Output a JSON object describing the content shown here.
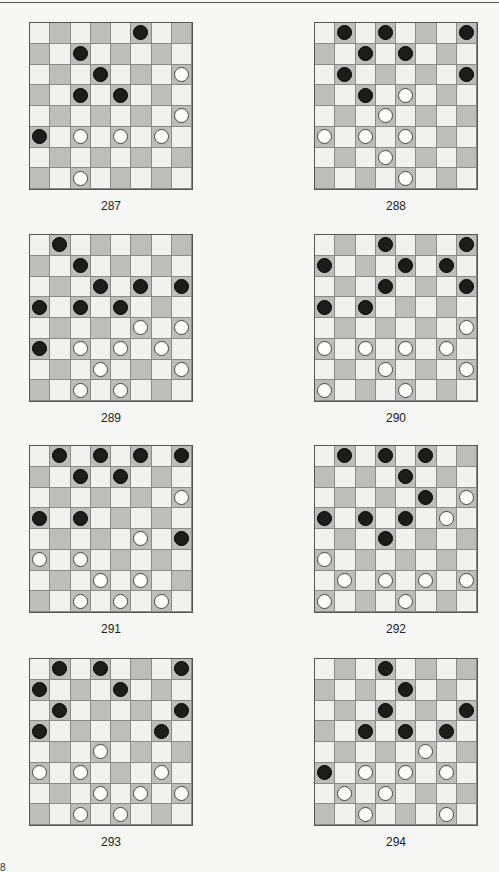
{
  "page": {
    "layout": "2 columns x 4 rows of checkers diagrams",
    "colors": {
      "dark_square": "#bdbdbb",
      "light_square": "#f1f1ef",
      "black_piece": "#1c1c1c",
      "white_piece": "#ffffff"
    },
    "bottom_fragment": "8"
  },
  "puzzles": [
    {
      "label": "287",
      "black": [
        [
          0,
          5
        ],
        [
          1,
          2
        ],
        [
          2,
          3
        ],
        [
          3,
          2
        ],
        [
          3,
          4
        ],
        [
          5,
          0
        ]
      ],
      "white": [
        [
          2,
          7
        ],
        [
          4,
          7
        ],
        [
          5,
          2
        ],
        [
          5,
          4
        ],
        [
          5,
          6
        ],
        [
          7,
          2
        ]
      ]
    },
    {
      "label": "288",
      "black": [
        [
          0,
          1
        ],
        [
          0,
          3
        ],
        [
          0,
          7
        ],
        [
          1,
          2
        ],
        [
          1,
          4
        ],
        [
          2,
          1
        ],
        [
          2,
          7
        ],
        [
          3,
          2
        ]
      ],
      "white": [
        [
          3,
          4
        ],
        [
          4,
          3
        ],
        [
          5,
          0
        ],
        [
          5,
          2
        ],
        [
          5,
          4
        ],
        [
          6,
          3
        ],
        [
          7,
          4
        ]
      ]
    },
    {
      "label": "289",
      "black": [
        [
          0,
          1
        ],
        [
          1,
          2
        ],
        [
          2,
          3
        ],
        [
          2,
          5
        ],
        [
          2,
          7
        ],
        [
          3,
          0
        ],
        [
          3,
          2
        ],
        [
          3,
          4
        ],
        [
          5,
          0
        ]
      ],
      "white": [
        [
          4,
          5
        ],
        [
          4,
          7
        ],
        [
          5,
          2
        ],
        [
          5,
          4
        ],
        [
          5,
          6
        ],
        [
          6,
          3
        ],
        [
          6,
          7
        ],
        [
          7,
          2
        ],
        [
          7,
          4
        ]
      ]
    },
    {
      "label": "290",
      "black": [
        [
          0,
          3
        ],
        [
          0,
          7
        ],
        [
          1,
          0
        ],
        [
          1,
          4
        ],
        [
          1,
          6
        ],
        [
          2,
          3
        ],
        [
          2,
          7
        ],
        [
          3,
          0
        ],
        [
          3,
          2
        ]
      ],
      "white": [
        [
          4,
          7
        ],
        [
          5,
          0
        ],
        [
          5,
          2
        ],
        [
          5,
          4
        ],
        [
          5,
          6
        ],
        [
          6,
          3
        ],
        [
          6,
          7
        ],
        [
          7,
          0
        ],
        [
          7,
          4
        ]
      ]
    },
    {
      "label": "291",
      "black": [
        [
          0,
          1
        ],
        [
          0,
          3
        ],
        [
          0,
          5
        ],
        [
          0,
          7
        ],
        [
          1,
          2
        ],
        [
          1,
          4
        ],
        [
          3,
          0
        ],
        [
          3,
          2
        ],
        [
          4,
          7
        ]
      ],
      "white": [
        [
          2,
          7
        ],
        [
          4,
          5
        ],
        [
          5,
          0
        ],
        [
          5,
          2
        ],
        [
          6,
          3
        ],
        [
          6,
          5
        ],
        [
          7,
          2
        ],
        [
          7,
          4
        ],
        [
          7,
          6
        ]
      ]
    },
    {
      "label": "292",
      "black": [
        [
          0,
          1
        ],
        [
          0,
          3
        ],
        [
          0,
          5
        ],
        [
          1,
          4
        ],
        [
          2,
          5
        ],
        [
          3,
          0
        ],
        [
          3,
          2
        ],
        [
          3,
          4
        ],
        [
          4,
          3
        ]
      ],
      "white": [
        [
          2,
          7
        ],
        [
          3,
          6
        ],
        [
          5,
          0
        ],
        [
          6,
          1
        ],
        [
          6,
          3
        ],
        [
          6,
          5
        ],
        [
          6,
          7
        ],
        [
          7,
          0
        ],
        [
          7,
          4
        ]
      ]
    },
    {
      "label": "293",
      "black": [
        [
          0,
          1
        ],
        [
          0,
          3
        ],
        [
          0,
          7
        ],
        [
          1,
          0
        ],
        [
          1,
          4
        ],
        [
          2,
          1
        ],
        [
          2,
          7
        ],
        [
          3,
          0
        ],
        [
          3,
          6
        ]
      ],
      "white": [
        [
          4,
          3
        ],
        [
          5,
          0
        ],
        [
          5,
          2
        ],
        [
          5,
          6
        ],
        [
          6,
          3
        ],
        [
          6,
          5
        ],
        [
          6,
          7
        ],
        [
          7,
          2
        ],
        [
          7,
          4
        ]
      ]
    },
    {
      "label": "294",
      "black": [
        [
          0,
          3
        ],
        [
          1,
          4
        ],
        [
          2,
          3
        ],
        [
          2,
          7
        ],
        [
          3,
          2
        ],
        [
          3,
          4
        ],
        [
          3,
          6
        ],
        [
          5,
          0
        ]
      ],
      "white": [
        [
          4,
          5
        ],
        [
          5,
          2
        ],
        [
          5,
          4
        ],
        [
          5,
          6
        ],
        [
          6,
          1
        ],
        [
          6,
          3
        ],
        [
          7,
          2
        ],
        [
          7,
          6
        ]
      ]
    }
  ]
}
